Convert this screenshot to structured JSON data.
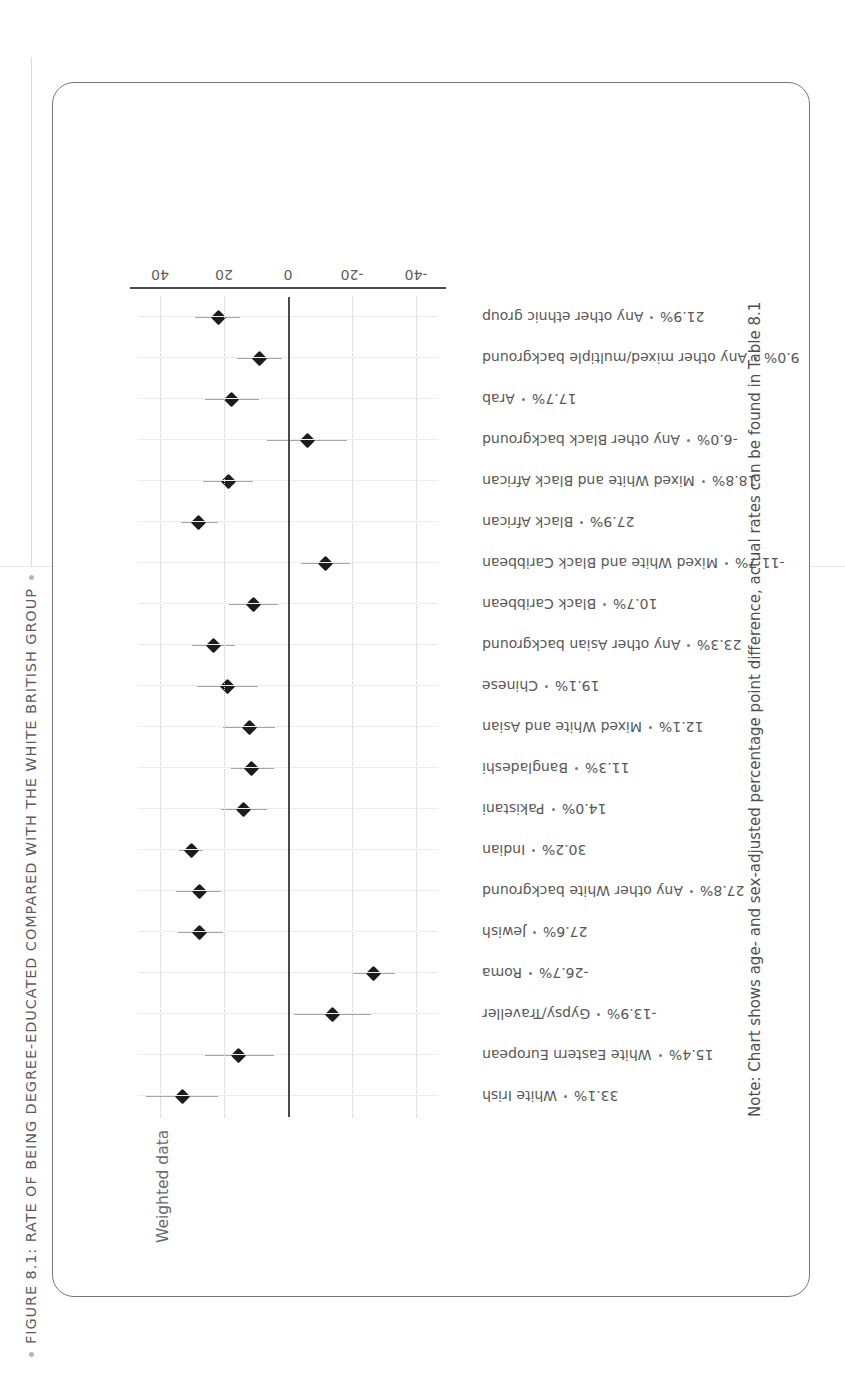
{
  "figure": {
    "title": "FIGURE 8.1: RATE OF BEING DEGREE-EDUCATED COMPARED WITH THE WHITE BRITISH GROUP",
    "weighted_label": "Weighted data",
    "note": "Note: Chart shows age- and sex-adjusted percentage point difference, actual rates can be found in Table 8.1"
  },
  "chart_data": {
    "type": "scatter",
    "title": "FIGURE 8.1: RATE OF BEING DEGREE-EDUCATED COMPARED WITH THE WHITE BRITISH GROUP",
    "subtitle": "Weighted data",
    "xlabel": "",
    "ylabel": "",
    "ylim": [
      -47,
      47
    ],
    "yticks": [
      -40,
      -20,
      0,
      40
    ],
    "ytick_labels": [
      "-40",
      "-20",
      "0",
      "20",
      "40"
    ],
    "grid": true,
    "legend": "none",
    "reference_line": 0,
    "annotation": "Note: Chart shows age- and sex-adjusted percentage point difference, actual rates can be found in Table 8.1",
    "categories": [
      "White Irish",
      "White Eastern European",
      "Gypsy/Traveller",
      "Roma",
      "Jewish",
      "Any other White background",
      "Indian",
      "Pakistani",
      "Bangladeshi",
      "Mixed White and Asian",
      "Chinese",
      "Any other Asian background",
      "Black Caribbean",
      "Mixed White and Black Caribbean",
      "Black African",
      "Mixed White and Black African",
      "Any other Black background",
      "Arab",
      "Any other mixed/multiple background",
      "Any other ethnic group"
    ],
    "value_labels": [
      "33.1%",
      "15.4%",
      "-13.9%",
      "-26.7%",
      "27.6%",
      "27.8%",
      "30.2%",
      "14.0%",
      "11.3%",
      "12.1%",
      "19.1%",
      "23.3%",
      "10.7%",
      "-11.7%",
      "27.9%",
      "18.8%",
      "-6.0%",
      "17.7%",
      "9.0%",
      "21.9%"
    ],
    "values": [
      33.1,
      15.4,
      -13.9,
      -26.7,
      27.6,
      27.8,
      30.2,
      14.0,
      11.3,
      12.1,
      19.1,
      23.3,
      10.7,
      -11.7,
      27.9,
      18.8,
      -6.0,
      17.7,
      9.0,
      21.9
    ],
    "ci_low": [
      22.0,
      4.5,
      -26.0,
      -33.5,
      20.5,
      21.0,
      26.5,
      6.5,
      4.5,
      4.0,
      9.5,
      16.5,
      3.0,
      -19.5,
      22.0,
      11.0,
      -18.5,
      9.0,
      2.0,
      15.0
    ],
    "ci_high": [
      44.5,
      26.0,
      -2.0,
      -20.0,
      34.5,
      35.0,
      34.0,
      21.0,
      18.0,
      20.5,
      28.5,
      30.0,
      18.5,
      -4.0,
      33.5,
      26.5,
      6.5,
      26.0,
      16.0,
      29.0
    ]
  },
  "rows": [
    {
      "label": "White Irish",
      "value": "33.1%"
    },
    {
      "label": "White Eastern European",
      "value": "15.4%"
    },
    {
      "label": "Gypsy/Traveller",
      "value": "-13.9%"
    },
    {
      "label": "Roma",
      "value": "-26.7%"
    },
    {
      "label": "Jewish",
      "value": "27.6%"
    },
    {
      "label": "Any other White background",
      "value": "27.8%"
    },
    {
      "label": "Indian",
      "value": "30.2%"
    },
    {
      "label": "Pakistani",
      "value": "14.0%"
    },
    {
      "label": "Bangladeshi",
      "value": "11.3%"
    },
    {
      "label": "Mixed White and Asian",
      "value": "12.1%"
    },
    {
      "label": "Chinese",
      "value": "19.1%"
    },
    {
      "label": "Any other Asian background",
      "value": "23.3%"
    },
    {
      "label": "Black Caribbean",
      "value": "10.7%"
    },
    {
      "label": "Mixed White and Black Caribbean",
      "value": "-11.7%"
    },
    {
      "label": "Black African",
      "value": "27.9%"
    },
    {
      "label": "Mixed White and Black African",
      "value": "18.8%"
    },
    {
      "label": "Any other Black background",
      "value": "-6.0%"
    },
    {
      "label": "Arab",
      "value": "17.7%"
    },
    {
      "label": "Any other mixed/multiple background",
      "value": "9.0%"
    },
    {
      "label": "Any other ethnic group",
      "value": "21.9%"
    }
  ],
  "axis": {
    "tick_labels": [
      "-40",
      "-20",
      "0",
      "20",
      "40"
    ],
    "tick_values": [
      -40,
      -20,
      0,
      20,
      40
    ]
  },
  "colors": {
    "marker": "#1c1c1c",
    "ci": "#a6a6a9",
    "grid": "#c9c9cc",
    "axis": "#4a4a4d",
    "text": "#58585a",
    "border": "#77777a"
  }
}
